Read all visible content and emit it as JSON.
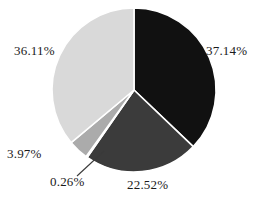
{
  "chart_data": {
    "type": "pie",
    "title": "",
    "subtitle": "",
    "xlabel": "",
    "ylabel": "",
    "grid": false,
    "legend": "none",
    "label_format": "percent",
    "start_angle_deg": 0,
    "direction": "clockwise",
    "center": {
      "x": 134,
      "y": 90
    },
    "radius": 82,
    "categories": [
      "37.14%",
      "22.52%",
      "0.26%",
      "3.97%",
      "36.11%"
    ],
    "values": [
      37.14,
      22.52,
      0.26,
      3.97,
      36.11
    ],
    "slices": [
      {
        "label": "37.14%",
        "value": 37.14,
        "color": "#111111"
      },
      {
        "label": "22.52%",
        "value": 22.52,
        "color": "#3b3b3b"
      },
      {
        "label": "0.26%",
        "value": 0.26,
        "color": "#fbfbfb"
      },
      {
        "label": "3.97%",
        "value": 3.97,
        "color": "#ababab"
      },
      {
        "label": "36.11%",
        "value": 36.11,
        "color": "#d9d9d9"
      }
    ],
    "total": 100.0,
    "separator_color": "#ffffff",
    "leader_line_color": "#3a3a3a",
    "background": "#ffffff"
  },
  "labels": {
    "black_slice": "37.14%",
    "dark_gray_slice": "22.52%",
    "sliver_slice": "0.26%",
    "mid_gray_slice": "3.97%",
    "light_gray_slice": "36.11%"
  }
}
